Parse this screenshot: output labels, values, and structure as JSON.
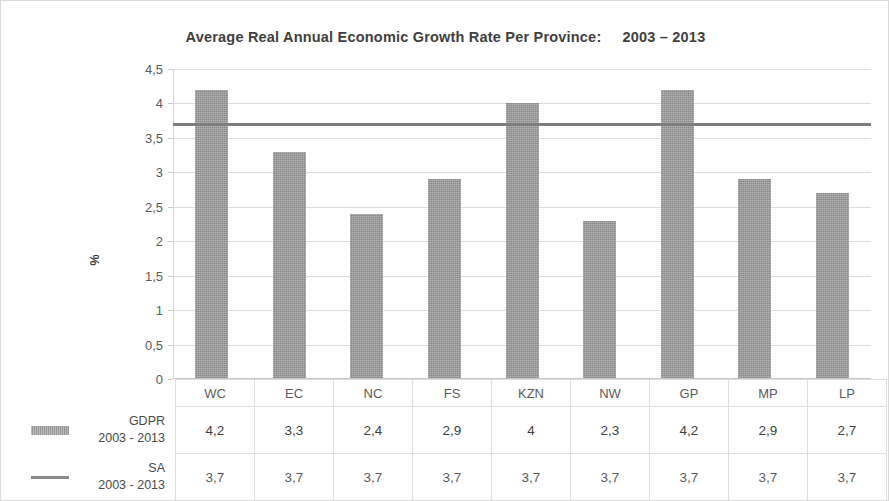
{
  "chart_data": {
    "type": "bar",
    "title": "Average Real Annual Economic Growth Rate Per Province:     2003 – 2013",
    "xlabel": "",
    "ylabel": "%",
    "ylim": [
      0,
      4.5
    ],
    "ytick_labels": [
      "4,5",
      "4",
      "3,5",
      "3",
      "2,5",
      "2",
      "1,5",
      "1",
      "0,5",
      "0"
    ],
    "ytick_values": [
      4.5,
      4,
      3.5,
      3,
      2.5,
      2,
      1.5,
      1,
      0.5,
      0
    ],
    "grid": true,
    "legend_position": "table-below",
    "categories": [
      "WC",
      "EC",
      "NC",
      "FS",
      "KZN",
      "NW",
      "GP",
      "MP",
      "LP"
    ],
    "series": [
      {
        "name": "GDPR",
        "period": "2003 - 2013",
        "render": "bar",
        "color": "#9b9b9b",
        "values": [
          4.2,
          3.3,
          2.4,
          2.9,
          4.0,
          2.3,
          4.2,
          2.9,
          2.7
        ],
        "labels": [
          "4,2",
          "3,3",
          "2,4",
          "2,9",
          "4",
          "2,3",
          "4,2",
          "2,9",
          "2,7"
        ]
      },
      {
        "name": "SA",
        "period": "2003 - 2013",
        "render": "line",
        "color": "#7d7d7d",
        "values": [
          3.7,
          3.7,
          3.7,
          3.7,
          3.7,
          3.7,
          3.7,
          3.7,
          3.7
        ],
        "labels": [
          "3,7",
          "3,7",
          "3,7",
          "3,7",
          "3,7",
          "3,7",
          "3,7",
          "3,7",
          "3,7"
        ]
      }
    ]
  },
  "legend": {
    "gdpr": {
      "name": "GDPR",
      "period": "2003 - 2013"
    },
    "sa": {
      "name": "SA",
      "period": "2003 - 2013"
    }
  }
}
